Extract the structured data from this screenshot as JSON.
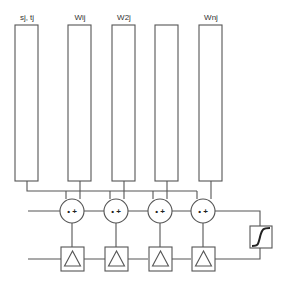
{
  "diagram": {
    "bars": [
      {
        "label": "sj, tj",
        "x": 15,
        "cx": 27
      },
      {
        "label": "Wij",
        "x": 68,
        "cx": 80
      },
      {
        "label": "W2j",
        "x": 112,
        "cx": 124
      },
      {
        "label": "",
        "x": 155,
        "cx": 167
      },
      {
        "label": "Wnj",
        "x": 199,
        "cx": 211
      }
    ],
    "nodes": [
      {
        "op": "• +",
        "cx": 72
      },
      {
        "op": "• +",
        "cx": 116
      },
      {
        "op": "• +",
        "cx": 160
      },
      {
        "op": "• +",
        "cx": 203
      }
    ],
    "delay_blocks": [
      {
        "symbol": "triangle",
        "cx": 72
      },
      {
        "symbol": "triangle",
        "cx": 116
      },
      {
        "symbol": "triangle",
        "cx": 160
      },
      {
        "symbol": "triangle",
        "cx": 203
      }
    ],
    "activation": {
      "symbol": "sigmoid"
    },
    "colors": {
      "line": "#555555",
      "background": "#ffffff"
    }
  }
}
